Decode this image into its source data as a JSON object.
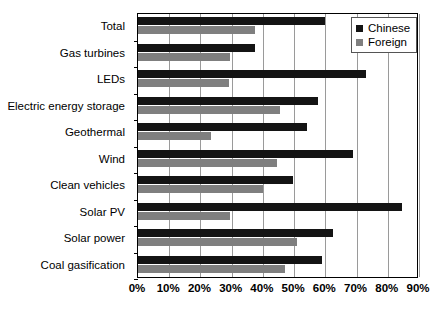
{
  "chart_data": {
    "type": "bar",
    "orientation": "horizontal",
    "title": "",
    "subtitle": "",
    "xlabel": "",
    "ylabel": "",
    "xlim": [
      0,
      90
    ],
    "xticks": [
      0,
      10,
      20,
      30,
      40,
      50,
      60,
      70,
      80,
      90
    ],
    "xtick_labels": [
      "0%",
      "10%",
      "20%",
      "30%",
      "40%",
      "50%",
      "60%",
      "70%",
      "80%",
      "90%"
    ],
    "grid": true,
    "grid_axis": "x",
    "legend_position": "top-right",
    "categories": [
      "Total",
      "Gas turbines",
      "LEDs",
      "Electric energy storage",
      "Geothermal",
      "Wind",
      "Clean vehicles",
      "Solar PV",
      "Solar power",
      "Coal gasification"
    ],
    "series": [
      {
        "name": "Chinese",
        "color": "#141414",
        "values": [
          60,
          37.5,
          73,
          57.5,
          54,
          69,
          49.5,
          84.5,
          62.5,
          59
        ]
      },
      {
        "name": "Foreign",
        "color": "#7f7f7f",
        "values": [
          37.5,
          29.5,
          29,
          45.5,
          23.5,
          44.5,
          40,
          29.5,
          51,
          47
        ]
      }
    ]
  }
}
